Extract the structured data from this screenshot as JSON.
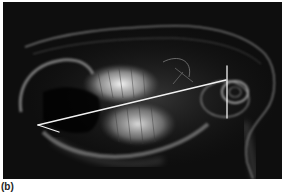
{
  "figure": {
    "panel_label": "(b)",
    "overlay_lines": [
      {
        "name": "occlusal-line",
        "from": [
          35,
          123
        ],
        "to": [
          223,
          78
        ]
      },
      {
        "name": "incisor-segment",
        "from": [
          35,
          123
        ],
        "to": [
          56,
          130
        ]
      },
      {
        "name": "condyle-vertical",
        "from": [
          224,
          64
        ],
        "to": [
          224,
          116
        ]
      }
    ],
    "colors": {
      "background": "#0e0e0e",
      "bone": "#d8d8d8",
      "line": "#f2f2f2"
    }
  }
}
